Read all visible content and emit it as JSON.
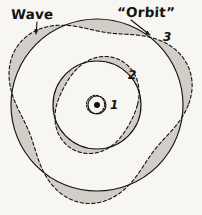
{
  "figure": {
    "background_color": "#f7f6f3",
    "ink_color": "#15130f",
    "shade_color": "#cfcbc4",
    "labels": {
      "wave": "Wave",
      "orbit": "“Orbit”",
      "n1": "1",
      "n2": "2",
      "n3": "3"
    }
  },
  "chart_data": {
    "type": "scatter",
    "xlabel": "",
    "ylabel": "",
    "legend_position": "none",
    "grid": false,
    "xlim": [
      0,
      202
    ],
    "ylim": [
      0,
      215
    ],
    "annotations": [
      {
        "text": "Wave",
        "x": 11,
        "y": 8,
        "arrow_to_x": 36,
        "arrow_to_y": 34
      },
      {
        "text": "“Orbit”",
        "x": 117,
        "y": 6,
        "arrow_to_x": 150,
        "arrow_to_y": 35
      },
      {
        "text": "3",
        "x": 163,
        "y": 31
      },
      {
        "text": "2",
        "x": 128,
        "y": 69
      },
      {
        "text": "1",
        "x": 110,
        "y": 99
      }
    ],
    "center": {
      "x": 97,
      "y": 105
    },
    "series": [
      {
        "name": "nucleus",
        "shape": "filled-dot",
        "cx": 97,
        "cy": 105,
        "r": 3.0,
        "values": [
          97,
          105,
          3.0
        ]
      },
      {
        "name": "orbit-1-circle",
        "shape": "circle",
        "quantum_number": 1,
        "lobes": 1,
        "cx": 97,
        "cy": 105,
        "r": 9.0,
        "stroke": "solid",
        "values": [
          97,
          105,
          9.0
        ]
      },
      {
        "name": "orbit-1-wave",
        "shape": "rose",
        "quantum_number": 1,
        "lobes": 1,
        "cx": 97,
        "cy": 105,
        "mean_r": 9.0,
        "amplitude": 1.6,
        "phase_deg": 200,
        "stroke": "dashed",
        "values": [
          9.0,
          1.6,
          1
        ]
      },
      {
        "name": "orbit-2-circle",
        "shape": "circle",
        "quantum_number": 2,
        "lobes": 2,
        "cx": 97,
        "cy": 105,
        "r": 44.0,
        "stroke": "solid",
        "values": [
          97,
          105,
          44.0
        ]
      },
      {
        "name": "orbit-2-wave",
        "shape": "rose",
        "quantum_number": 2,
        "lobes": 2,
        "cx": 97,
        "cy": 105,
        "mean_r": 44.0,
        "amplitude": 6.5,
        "phase_deg": 118,
        "stroke": "dashed",
        "values": [
          44.0,
          6.5,
          2
        ]
      },
      {
        "name": "orbit-3-circle",
        "shape": "circle",
        "quantum_number": 3,
        "lobes": 3,
        "cx": 97,
        "cy": 105,
        "r": 86.0,
        "stroke": "solid",
        "values": [
          97,
          105,
          86.0
        ]
      },
      {
        "name": "orbit-3-wave",
        "shape": "rose",
        "quantum_number": 3,
        "lobes": 3,
        "cx": 97,
        "cy": 105,
        "mean_r": 86.0,
        "amplitude": 13.0,
        "phase_deg": 98,
        "stroke": "dashed",
        "values": [
          86.0,
          13.0,
          3
        ]
      }
    ]
  }
}
